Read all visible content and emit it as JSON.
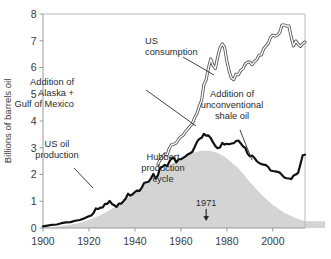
{
  "chart_data": {
    "type": "area",
    "title": "",
    "subtitle": "",
    "xlabel": "",
    "ylabel": "Billions of barrels oil",
    "xlim": [
      1900,
      2014
    ],
    "ylim": [
      0,
      8
    ],
    "grid": false,
    "legend": "none",
    "legend_position": "none",
    "xticks": [
      "1900",
      "1920",
      "1940",
      "1960",
      "1980",
      "2000"
    ],
    "xtick_values": [
      1900,
      1920,
      1940,
      1960,
      1980,
      2000
    ],
    "yticks": [
      "0",
      "1",
      "2",
      "3",
      "4",
      "5",
      "6",
      "7",
      "8"
    ],
    "ytick_values": [
      0,
      1,
      2,
      3,
      4,
      5,
      6,
      7,
      8
    ],
    "series": [
      {
        "name": "Hubbert production cycle",
        "render": "area",
        "fill_color": "#d4d4d4",
        "line_color": "none",
        "peak_year": 1971,
        "peak_value": 2.9,
        "x": [
          1900,
          1905,
          1910,
          1915,
          1920,
          1925,
          1930,
          1935,
          1940,
          1945,
          1950,
          1955,
          1960,
          1963,
          1966,
          1969,
          1971,
          1973,
          1976,
          1979,
          1982,
          1985,
          1990,
          1995,
          2000,
          2005,
          2010,
          2014
        ],
        "values": [
          0.02,
          0.04,
          0.09,
          0.17,
          0.3,
          0.48,
          0.72,
          1.0,
          1.33,
          1.68,
          2.03,
          2.35,
          2.62,
          2.74,
          2.83,
          2.89,
          2.9,
          2.88,
          2.8,
          2.66,
          2.46,
          2.23,
          1.72,
          1.25,
          0.86,
          0.57,
          0.36,
          0.25
        ]
      },
      {
        "name": "US oil production",
        "render": "line",
        "line_color": "#111111",
        "line_width": 2.2,
        "x": [
          1900,
          1902,
          1904,
          1906,
          1908,
          1910,
          1912,
          1914,
          1916,
          1918,
          1920,
          1921,
          1922,
          1923,
          1924,
          1925,
          1926,
          1927,
          1928,
          1929,
          1930,
          1931,
          1932,
          1933,
          1934,
          1935,
          1936,
          1937,
          1938,
          1939,
          1940,
          1941,
          1942,
          1943,
          1944,
          1945,
          1946,
          1947,
          1948,
          1949,
          1950,
          1951,
          1952,
          1953,
          1954,
          1955,
          1956,
          1957,
          1958,
          1959,
          1960,
          1961,
          1962,
          1963,
          1964,
          1965,
          1966,
          1967,
          1968,
          1969,
          1970,
          1971,
          1972,
          1973,
          1974,
          1975,
          1976,
          1977,
          1978,
          1979,
          1980,
          1981,
          1982,
          1983,
          1984,
          1985,
          1986,
          1987,
          1988,
          1989,
          1990,
          1991,
          1992,
          1993,
          1994,
          1995,
          1996,
          1997,
          1998,
          1999,
          2000,
          2001,
          2002,
          2003,
          2004,
          2005,
          2006,
          2007,
          2008,
          2009,
          2010,
          2011,
          2012,
          2013,
          2014
        ],
        "values": [
          0.06,
          0.09,
          0.12,
          0.13,
          0.18,
          0.21,
          0.22,
          0.27,
          0.3,
          0.36,
          0.44,
          0.47,
          0.56,
          0.73,
          0.71,
          0.76,
          0.77,
          0.9,
          0.9,
          1.01,
          0.9,
          0.85,
          0.79,
          0.91,
          0.91,
          1.0,
          1.1,
          1.28,
          1.21,
          1.26,
          1.35,
          1.4,
          1.39,
          1.51,
          1.68,
          1.71,
          1.73,
          1.86,
          2.02,
          1.84,
          1.97,
          2.25,
          2.29,
          2.36,
          2.31,
          2.48,
          2.62,
          2.62,
          2.45,
          2.57,
          2.57,
          2.62,
          2.68,
          2.75,
          2.79,
          2.85,
          3.03,
          3.22,
          3.33,
          3.37,
          3.52,
          3.45,
          3.46,
          3.36,
          3.2,
          3.06,
          2.98,
          3.01,
          3.18,
          3.12,
          3.15,
          3.13,
          3.16,
          3.17,
          3.25,
          3.27,
          3.17,
          3.05,
          3.0,
          2.78,
          2.68,
          2.71,
          2.62,
          2.5,
          2.43,
          2.39,
          2.37,
          2.35,
          2.28,
          2.15,
          2.13,
          2.12,
          2.1,
          2.07,
          1.98,
          1.89,
          1.86,
          1.85,
          1.83,
          1.96,
          2.0,
          2.06,
          2.38,
          2.72,
          2.74
        ]
      },
      {
        "name": "US consumption",
        "render": "line-outlined",
        "line_color": "#111111",
        "line_width": 1.0,
        "x": [
          1950,
          1951,
          1952,
          1953,
          1954,
          1955,
          1956,
          1957,
          1958,
          1959,
          1960,
          1961,
          1962,
          1963,
          1964,
          1965,
          1966,
          1967,
          1968,
          1969,
          1970,
          1971,
          1972,
          1973,
          1974,
          1975,
          1976,
          1977,
          1978,
          1979,
          1980,
          1981,
          1982,
          1983,
          1984,
          1985,
          1986,
          1987,
          1988,
          1989,
          1990,
          1991,
          1992,
          1993,
          1994,
          1995,
          1996,
          1997,
          1998,
          1999,
          2000,
          2001,
          2002,
          2003,
          2004,
          2005,
          2006,
          2007,
          2008,
          2009,
          2010,
          2011,
          2012,
          2013,
          2014
        ],
        "values": [
          2.38,
          2.55,
          2.65,
          2.77,
          2.73,
          2.99,
          3.12,
          3.13,
          3.18,
          3.32,
          3.41,
          3.47,
          3.6,
          3.7,
          3.8,
          3.9,
          4.13,
          4.28,
          4.55,
          4.77,
          5.36,
          5.55,
          5.99,
          6.32,
          6.08,
          5.96,
          6.39,
          6.73,
          6.88,
          6.76,
          6.24,
          5.86,
          5.6,
          5.55,
          5.75,
          5.73,
          5.89,
          5.95,
          6.13,
          6.2,
          6.2,
          6.1,
          6.23,
          6.29,
          6.46,
          6.47,
          6.7,
          6.8,
          6.9,
          7.13,
          7.21,
          7.17,
          7.21,
          7.31,
          7.59,
          7.59,
          7.55,
          7.55,
          7.14,
          6.81,
          6.99,
          6.87,
          6.79,
          6.89,
          6.95
        ]
      }
    ],
    "annotations": [
      {
        "name": "us-consumption",
        "lines": [
          "US",
          "consumption"
        ],
        "align": "left",
        "x": 145,
        "y": 44
      },
      {
        "name": "alaska-gulf",
        "lines": [
          "Addition of",
          "Alaska +",
          "Gulf of Mexico"
        ],
        "align": "right",
        "x": 74,
        "y": 85
      },
      {
        "name": "unconventional-shale",
        "lines": [
          "Addition of",
          "unconventional",
          "shale oil"
        ],
        "align": "center",
        "x": 232,
        "y": 97
      },
      {
        "name": "us-oil-production",
        "lines": [
          "US oil",
          "production"
        ],
        "align": "center",
        "x": 57,
        "y": 147
      },
      {
        "name": "hubbert-production-cycle",
        "lines": [
          "Hubbert",
          "production",
          "cycle"
        ],
        "align": "center",
        "x": 163,
        "y": 160
      }
    ],
    "marker": {
      "label": "1971",
      "year": 1971,
      "arrow": "down"
    }
  },
  "axis": {
    "ylabel": "Billions of barrels oil",
    "ytick_labels": [
      "8",
      "7",
      "6",
      "5",
      "4",
      "3",
      "2",
      "1",
      "0"
    ],
    "xtick_labels": [
      "1900",
      "1920",
      "1940",
      "1960",
      "1980",
      "2000"
    ]
  }
}
